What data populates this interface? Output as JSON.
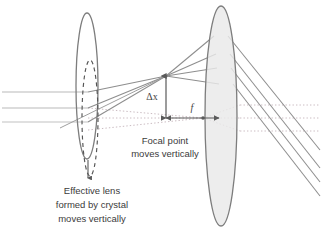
{
  "figure": {
    "kind": "optics-ray-diagram",
    "background_color": "#ffffff",
    "width": 322,
    "height": 235
  },
  "palette": {
    "ray_solid": "#8a8a8a",
    "ray_incoming": "#b4b4b4",
    "ray_dotted": "#c9b8bf",
    "lens_outline": "#7d7d7d",
    "lens_fill": "#e9e9e9",
    "dashed_lens": "#555555",
    "arrow": "#5a5a5a",
    "text": "#3b3b3b"
  },
  "labels": {
    "delta_x": "Δx",
    "focal_length": "f",
    "focal_point_note_line1": "Focal point",
    "focal_point_note_line2": "moves vertically",
    "effective_lens_note_line1": "Effective lens",
    "effective_lens_note_line2": "formed by crystal",
    "effective_lens_note_line3": "moves vertically"
  },
  "elements": {
    "crystal_lens_name": "effective-lens-crystal",
    "crystal_lens_shifted_name": "effective-lens-shifted-dashed",
    "objective_lens_name": "objective-lens",
    "focal_point_upper_name": "focal-point-shifted",
    "focal_point_lower_name": "focal-point-axial",
    "delta_x_arrow_name": "delta-x-dimension-arrow",
    "focal_length_arrow_name": "focal-length-arrow",
    "shift_arrow_name": "lens-shift-down-arrow"
  },
  "geometry": {
    "incoming_ray_y": [
      92,
      108,
      122
    ],
    "crystal_lens_center_x": 87,
    "crystal_lens_center_y": 86,
    "crystal_lens_rx": 11,
    "crystal_lens_ry": 73,
    "objective_lens_center_x": 221,
    "objective_lens_center_y": 116,
    "objective_lens_rx": 16,
    "objective_lens_ry": 110,
    "focal_point_upper": [
      203,
      118
    ],
    "focal_point_lower": [
      203,
      118
    ],
    "delta_x_top_y": 76,
    "delta_x_bottom_y": 118,
    "focal_length_start_x": 166,
    "focal_length_end_x": 221
  }
}
